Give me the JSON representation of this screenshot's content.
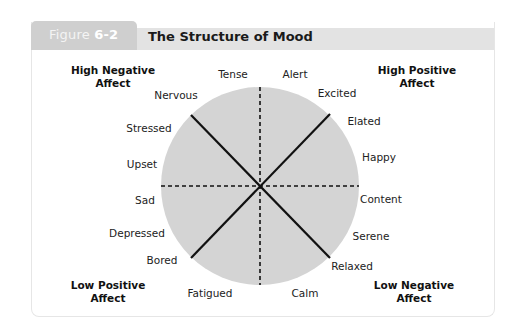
{
  "figure": {
    "label_prefix": "Figure",
    "label_number": "6-2",
    "title": "The Structure of Mood"
  },
  "colors": {
    "circle_fill": "#d4d4d4",
    "header_bar": "#e3e3e3",
    "figure_tab": "#cfcfcf",
    "line": "#111111"
  },
  "corners": {
    "top_left": [
      "High Negative",
      "Affect"
    ],
    "top_right": [
      "High Positive",
      "Affect"
    ],
    "bottom_left": [
      "Low Positive",
      "Affect"
    ],
    "bottom_right": [
      "Low Negative",
      "Affect"
    ]
  },
  "moods": {
    "tense": "Tense",
    "alert": "Alert",
    "excited": "Excited",
    "elated": "Elated",
    "happy": "Happy",
    "content": "Content",
    "serene": "Serene",
    "relaxed": "Relaxed",
    "calm": "Calm",
    "fatigued": "Fatigued",
    "bored": "Bored",
    "depressed": "Depressed",
    "sad": "Sad",
    "upset": "Upset",
    "stressed": "Stressed",
    "nervous": "Nervous"
  }
}
